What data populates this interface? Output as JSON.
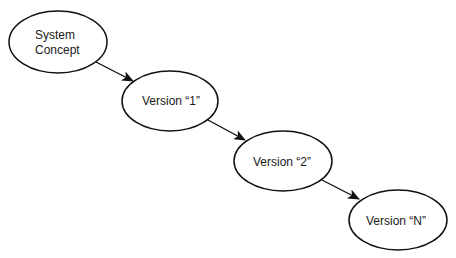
{
  "diagram": {
    "type": "flow",
    "direction": "diagonal top-left to bottom-right",
    "colors": {
      "background": "#ffffff",
      "stroke": "#111111",
      "text": "#1a1a1a"
    },
    "nodes": [
      {
        "id": "system-concept",
        "shape": "ellipse",
        "label_lines": [
          "System",
          "Concept"
        ],
        "cx": 58,
        "cy": 42,
        "rx": 49,
        "ry": 31
      },
      {
        "id": "version-1",
        "shape": "ellipse",
        "label": "Version “1”",
        "cx": 170,
        "cy": 101,
        "rx": 48,
        "ry": 30
      },
      {
        "id": "version-2",
        "shape": "ellipse",
        "label": "Version “2”",
        "cx": 283,
        "cy": 161,
        "rx": 49,
        "ry": 30
      },
      {
        "id": "version-n",
        "shape": "ellipse",
        "label": "Version “N”",
        "cx": 398,
        "cy": 220,
        "rx": 49,
        "ry": 30
      }
    ],
    "edges": [
      {
        "from": "system-concept",
        "to": "version-1",
        "arrow": "end"
      },
      {
        "from": "version-1",
        "to": "version-2",
        "arrow": "end"
      },
      {
        "from": "version-2",
        "to": "version-n",
        "arrow": "end"
      }
    ]
  }
}
